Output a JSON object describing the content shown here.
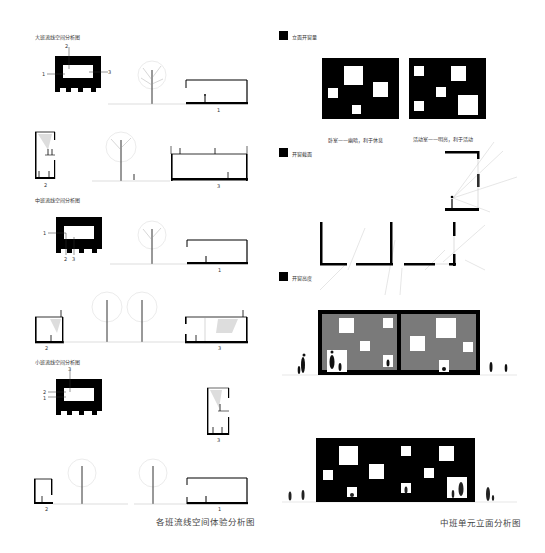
{
  "left_panel": {
    "sections": [
      {
        "title": "大班流线空间分析图",
        "plan_labels": [
          "1",
          "2",
          "3"
        ],
        "section_labels": [
          "1",
          "2",
          "3"
        ]
      },
      {
        "title": "中班流线空间分析图",
        "plan_labels": [
          "1",
          "2",
          "3"
        ],
        "section_labels": [
          "1",
          "2",
          "3"
        ]
      },
      {
        "title": "小班流线空间分析图",
        "plan_labels": [
          "1",
          "2",
          "3"
        ],
        "section_labels": [
          "1",
          "2",
          "3"
        ]
      }
    ],
    "caption": "各班流线空间体验分析图"
  },
  "right_panel": {
    "legend": [
      {
        "label": "立面开窗量"
      },
      {
        "label": "开窗截面"
      },
      {
        "label": "开窗高度"
      }
    ],
    "notes": {
      "bedroom": "卧室——幽暗，利于休息",
      "activity": "活动室——明亮，利于活动"
    },
    "caption": "中班单元立面分析图"
  },
  "colors": {
    "ink": "#000000",
    "wall_gray": "#7a7a7a",
    "background": "#ffffff",
    "text": "#444444"
  }
}
